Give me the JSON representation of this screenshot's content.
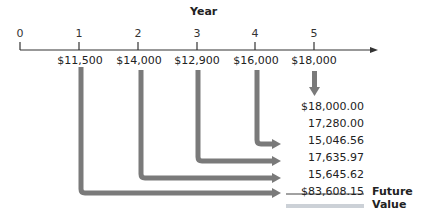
{
  "diagram": {
    "axis_title": "Year",
    "years": [
      "0",
      "1",
      "2",
      "3",
      "4",
      "5"
    ],
    "cash_flows": [
      "$11,500",
      "$14,000",
      "$12,900",
      "$16,000",
      "$18,000"
    ],
    "future_values": [
      "$18,000.00",
      "17,280.00",
      "15,046.56",
      "17,635.97",
      "15,645.62"
    ],
    "total": "$83,608.15",
    "total_label": "Future Value",
    "arrow_color": "#7a7a7a",
    "line_color": "#333333",
    "underline_color": "#9aa3b0"
  }
}
